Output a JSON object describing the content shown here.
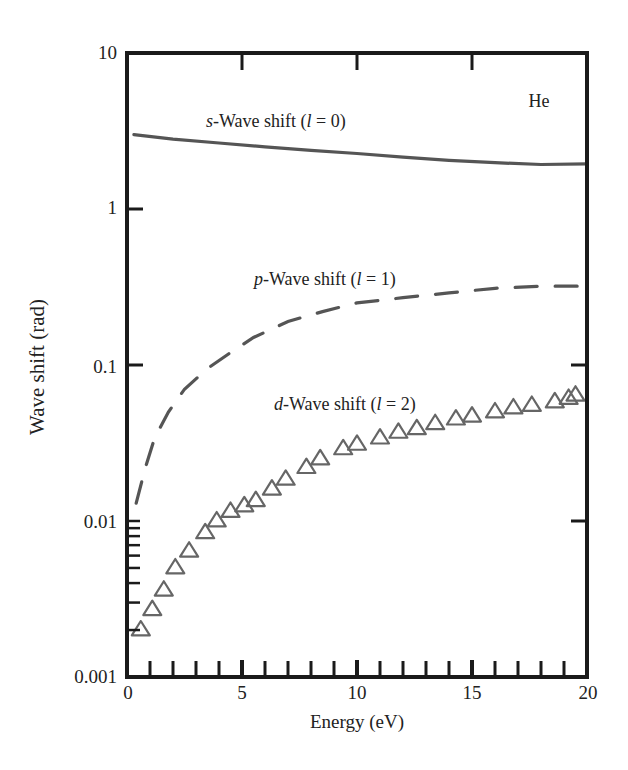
{
  "chart_data": {
    "type": "line",
    "title": "",
    "xlabel": "Energy (eV)",
    "ylabel": "Wave shift (rad)",
    "xlim": [
      0,
      20
    ],
    "ylim": [
      0.001,
      10
    ],
    "yscale": "log",
    "x_ticks": [
      "0",
      "5",
      "10",
      "15",
      "20"
    ],
    "y_ticks": [
      "0.001",
      "0.01",
      "0.1",
      "1",
      "10"
    ],
    "grid": false,
    "legend": "none (inline annotations)",
    "annotations": [
      {
        "text": "He",
        "x": 17.0,
        "y": 5.0
      },
      {
        "text": "s-Wave shift  (l = 0)",
        "series": "s-wave"
      },
      {
        "text": "p-Wave shift (l = 1)",
        "series": "p-wave"
      },
      {
        "text": "d-Wave shift (l = 2)",
        "series": "d-wave"
      }
    ],
    "series": [
      {
        "name": "s-Wave shift (l = 0)",
        "style": "solid",
        "x": [
          0.3,
          2,
          4,
          6,
          8,
          10,
          12,
          14,
          16,
          18,
          20
        ],
        "values": [
          3.0,
          2.8,
          2.65,
          2.5,
          2.38,
          2.27,
          2.15,
          2.05,
          1.98,
          1.93,
          1.95
        ]
      },
      {
        "name": "p-Wave shift (l = 1)",
        "style": "dashed",
        "x": [
          0.4,
          0.8,
          1.2,
          1.8,
          2.5,
          3.5,
          4.5,
          5.5,
          7,
          8.5,
          10,
          12,
          14,
          16,
          18,
          20
        ],
        "values": [
          0.013,
          0.022,
          0.034,
          0.05,
          0.07,
          0.095,
          0.12,
          0.15,
          0.19,
          0.22,
          0.25,
          0.27,
          0.29,
          0.31,
          0.32,
          0.32
        ]
      },
      {
        "name": "d-Wave shift (l = 2)",
        "style": "triangle markers",
        "x": [
          0.6,
          1.1,
          1.6,
          2.1,
          2.7,
          3.4,
          3.9,
          4.5,
          5.1,
          5.6,
          6.3,
          6.9,
          7.8,
          8.4,
          9.4,
          10.0,
          11.0,
          11.8,
          12.6,
          13.4,
          14.3,
          15.0,
          16.0,
          16.8,
          17.6,
          18.6,
          19.2,
          19.5
        ],
        "values": [
          0.002,
          0.0027,
          0.0036,
          0.005,
          0.0064,
          0.0084,
          0.01,
          0.0115,
          0.0125,
          0.0135,
          0.016,
          0.0185,
          0.022,
          0.025,
          0.029,
          0.031,
          0.034,
          0.037,
          0.039,
          0.042,
          0.045,
          0.047,
          0.05,
          0.053,
          0.055,
          0.058,
          0.061,
          0.064
        ]
      }
    ]
  },
  "labels": {
    "he": "He",
    "s_prefix": "s",
    "s_text": "-Wave shift  (",
    "s_l": "l",
    "s_suffix": " = 0)",
    "p_prefix": "p",
    "p_text": "-Wave shift (",
    "p_l": "l",
    "p_suffix": " = 1)",
    "d_prefix": "d",
    "d_text": "-Wave shift (",
    "d_l": "l",
    "d_suffix": " = 2)",
    "xlabel": "Energy (eV)",
    "ylabel": "Wave shift (rad)",
    "xticks": [
      "0",
      "5",
      "10",
      "15",
      "20"
    ],
    "yticks": [
      "10",
      "1",
      "0.1",
      "0.01",
      "0.001"
    ]
  }
}
